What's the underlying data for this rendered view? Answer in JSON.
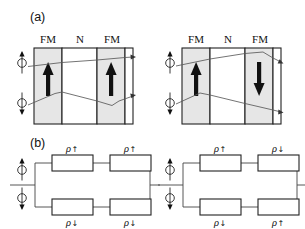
{
  "figure": {
    "background_color": "#ffffff",
    "ink_color": "#111111",
    "fm_layer_color": "#e6e6e6",
    "n_layer_color": "#ffffff"
  },
  "panels": {
    "a": {
      "label": "(a)",
      "layer_labels": [
        "FM",
        "N",
        "FM"
      ],
      "left_diagram": {
        "name": "parallel-configuration",
        "magnetization": [
          "up",
          "up"
        ],
        "spin_channels": [
          "up",
          "down"
        ],
        "up_channel_scattering": "weak",
        "down_channel_scattering": "strong"
      },
      "right_diagram": {
        "name": "antiparallel-configuration",
        "magnetization": [
          "up",
          "down"
        ],
        "spin_channels": [
          "up",
          "down"
        ],
        "up_channel_scattering": "strong-in-second-layer",
        "down_channel_scattering": "strong-in-first-layer"
      }
    },
    "b": {
      "label": "(b)",
      "left_circuit": {
        "name": "parallel-resistor-network",
        "spin_channels": [
          "up",
          "down"
        ],
        "top_branch": [
          {
            "symbol": "ρ",
            "spin": "↑"
          },
          {
            "symbol": "ρ",
            "spin": "↑"
          }
        ],
        "bottom_branch": [
          {
            "symbol": "ρ",
            "spin": "↓"
          },
          {
            "symbol": "ρ",
            "spin": "↓"
          }
        ]
      },
      "right_circuit": {
        "name": "antiparallel-resistor-network",
        "spin_channels": [
          "up",
          "down"
        ],
        "top_branch": [
          {
            "symbol": "ρ",
            "spin": "↑"
          },
          {
            "symbol": "ρ",
            "spin": "↓"
          }
        ],
        "bottom_branch": [
          {
            "symbol": "ρ",
            "spin": "↓"
          },
          {
            "symbol": "ρ",
            "spin": "↑"
          }
        ]
      }
    }
  },
  "labels": {
    "panel_a": "(a)",
    "panel_b": "(b)",
    "fm": "FM",
    "n": "N",
    "rho": "ρ",
    "arrow_up": "↑",
    "arrow_down": "↓"
  }
}
